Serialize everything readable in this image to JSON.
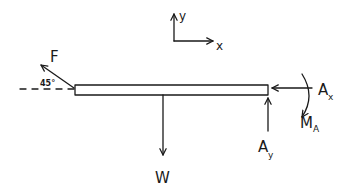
{
  "diagram": {
    "type": "free-body-diagram",
    "style": "hand-drawn",
    "colors": {
      "ink": "#1a1a1a",
      "background": "#ffffff"
    },
    "axes": {
      "x_label": "x",
      "y_label": "y"
    },
    "beam": {
      "shape": "rectangle"
    },
    "forces": {
      "F": {
        "label": "F",
        "angle_label": "45°",
        "direction": "up-left at 45° from horizontal"
      },
      "W": {
        "label": "W",
        "direction": "down"
      },
      "Ax": {
        "label": "A",
        "subscript": "x",
        "direction": "left"
      },
      "Ay": {
        "label": "A",
        "subscript": "y",
        "direction": "up"
      },
      "MA": {
        "label": "M",
        "subscript": "A",
        "direction": "clockwise moment"
      }
    }
  }
}
